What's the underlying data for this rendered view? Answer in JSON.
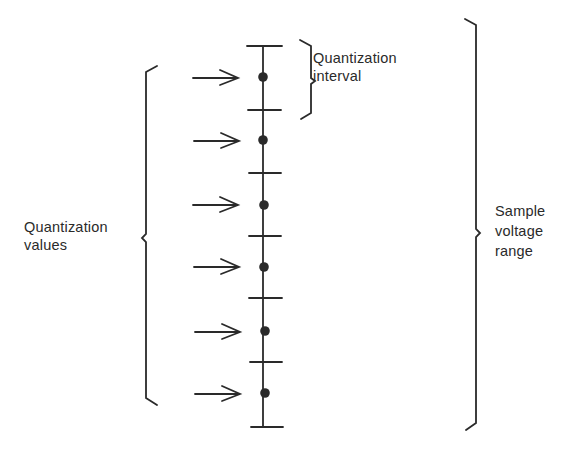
{
  "diagram": {
    "colors": {
      "ink": "#2a2a2a",
      "background": "#ffffff"
    },
    "labels": {
      "quantization_interval": {
        "line1": "Quantization",
        "line2": "interval"
      },
      "quantization_values": {
        "line1": "Quantization",
        "line2": "values"
      },
      "sample_voltage_range": {
        "line1": "Sample",
        "line2": "voltage",
        "line3": "range"
      }
    },
    "axis": {
      "x": 263,
      "top": 46,
      "bottom": 427
    },
    "ticks_y": [
      46,
      110,
      173,
      236,
      298,
      362,
      427
    ],
    "quantization_points_y": [
      77,
      140,
      205,
      267,
      331,
      393
    ],
    "arrow_count": 6
  }
}
